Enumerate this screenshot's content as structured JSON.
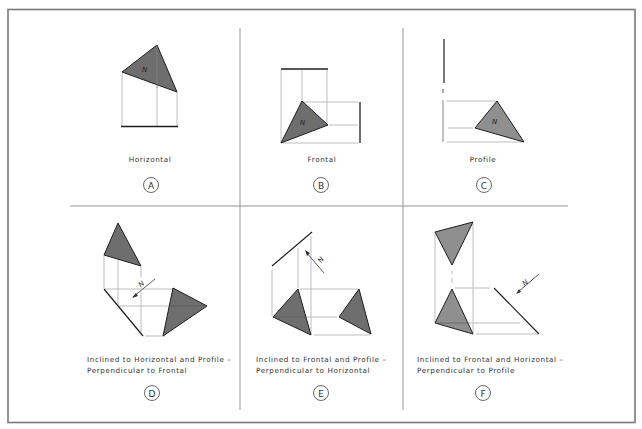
{
  "figure": {
    "colors": {
      "frame": "#7a7a7a",
      "divider": "#8a8a8a",
      "projector": "#b5b5b5",
      "edge": "#1e1e1e",
      "fill_dark": "#6e6e6e",
      "fill_light": "#8f8f8f"
    },
    "normal_symbol": "N",
    "panels": [
      {
        "id": "A",
        "caption_lines": [
          "Horizontal"
        ]
      },
      {
        "id": "B",
        "caption_lines": [
          "Frontal"
        ]
      },
      {
        "id": "C",
        "caption_lines": [
          "Profile"
        ]
      },
      {
        "id": "D",
        "caption_lines": [
          "Inclined to Horizontal and Profile –",
          "Perpendicular to Frontal"
        ]
      },
      {
        "id": "E",
        "caption_lines": [
          "Inclined to Frontal and Profile –",
          "Perpendicular to Horizontal"
        ]
      },
      {
        "id": "F",
        "caption_lines": [
          "Inclined to Frontal and Horizontal –",
          "Perpendicular to Profile"
        ]
      }
    ]
  }
}
